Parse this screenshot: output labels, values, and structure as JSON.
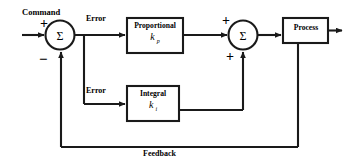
{
  "diagram": {
    "colors": {
      "line": "#1a1a1a",
      "background": "#ffffff",
      "text": "#000000"
    },
    "labels": {
      "command": "Command",
      "error_top": "Error",
      "error_bottom": "Error",
      "feedback": "Feedback"
    },
    "signs": {
      "sum1_plus": "+",
      "sum1_minus": "−",
      "sum2_plus_top": "+",
      "sum2_plus_bottom": "+"
    },
    "summing_junctions": [
      {
        "name": "sum1",
        "symbol": "Σ"
      },
      {
        "name": "sum2",
        "symbol": "Σ"
      }
    ],
    "blocks": [
      {
        "name": "proportional",
        "title": "Proportional",
        "gain": "k",
        "gain_subscript": "p"
      },
      {
        "name": "integral",
        "title": "Integral",
        "gain": "k",
        "gain_subscript": "i"
      },
      {
        "name": "process",
        "title": "Process",
        "gain": "",
        "gain_subscript": ""
      }
    ]
  }
}
